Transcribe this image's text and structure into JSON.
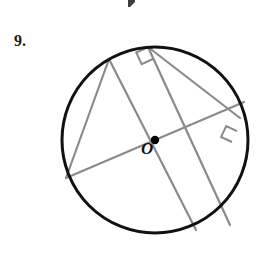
{
  "page": {
    "background_color": "#ffffff",
    "width": 271,
    "height": 259
  },
  "problem": {
    "number_label": "9.",
    "center_label": "O"
  },
  "colors": {
    "circle_stroke": "#111111",
    "chord_stroke": "#8a8a8a",
    "right_angle_stroke": "#8a8a8a",
    "center_dot": "#000000",
    "text": "#1a1a1a",
    "artifact": "#2e2e2e"
  },
  "figure": {
    "type": "circle-with-inscribed-chords",
    "circle": {
      "cx": 155,
      "cy": 140,
      "r": 93,
      "stroke_width": 3.0
    },
    "center_dot": {
      "cx": 155,
      "cy": 140,
      "r": 4.2
    },
    "chords": [
      {
        "name": "chord-topleft-to-bottomright",
        "x1": 109,
        "y1": 59,
        "x2": 196,
        "y2": 230,
        "stroke_width": 2.2
      },
      {
        "name": "chord-topleft-to-left",
        "x1": 109,
        "y1": 59,
        "x2": 66,
        "y2": 178,
        "stroke_width": 2.2
      },
      {
        "name": "chord-left-to-topright-diameter",
        "x1": 66,
        "y1": 178,
        "x2": 244,
        "y2": 102,
        "stroke_width": 2.2
      },
      {
        "name": "chord-top-to-bottomright",
        "x1": 148,
        "y1": 47,
        "x2": 230,
        "y2": 225,
        "stroke_width": 2.2
      },
      {
        "name": "chord-top-to-right",
        "x1": 148,
        "y1": 47,
        "x2": 240,
        "y2": 118,
        "stroke_width": 2.2
      }
    ],
    "right_angle_markers": [
      {
        "name": "right-angle-top",
        "vertex_x": 148,
        "vertex_y": 47,
        "size": 13,
        "angle_a_deg": 65,
        "angle_b_deg": 155
      },
      {
        "name": "right-angle-right",
        "vertex_x": 232,
        "vertex_y": 142,
        "size": 12,
        "angle_a_deg": 295,
        "angle_b_deg": 205
      }
    ]
  },
  "artifact": {
    "name": "top-edge-scan-artifact",
    "visible": true
  }
}
